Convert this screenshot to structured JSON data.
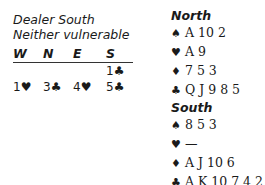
{
  "header": {
    "dealer": "Dealer South",
    "vulnerability": "Neither vulnerable"
  },
  "auction": {
    "columns": [
      "W",
      "N",
      "E",
      "S"
    ],
    "rows": [
      [
        "",
        "",
        "",
        "1♣"
      ],
      [
        "1♥",
        "3♣",
        "4♥",
        "5♣"
      ]
    ]
  },
  "hands": {
    "north": {
      "title": "North",
      "spades": "A 10 2",
      "hearts": "A 9",
      "diamonds": "7 5 3",
      "clubs": "Q J 9 8 5"
    },
    "south": {
      "title": "South",
      "spades": "8 5 3",
      "hearts": "—",
      "diamonds": "A J 10 6",
      "clubs": "A K 10 7 4 2"
    }
  },
  "icons": {
    "spade": "♠",
    "heart": "♥",
    "diamond": "♦",
    "club": "♣"
  }
}
